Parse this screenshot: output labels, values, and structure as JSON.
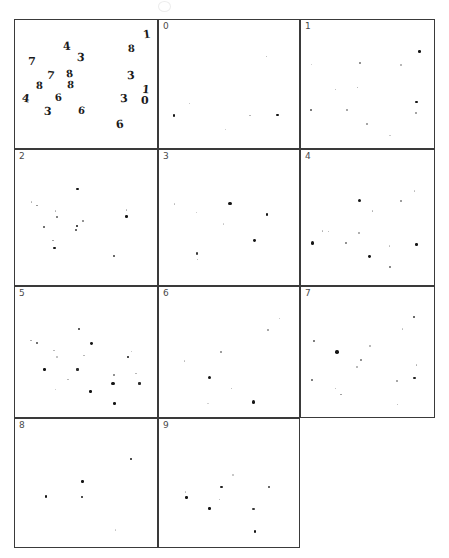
{
  "figure": {
    "width": 449,
    "height": 558,
    "background_color": "#ffffff",
    "ink_color": "#151515",
    "border_color": "#3a3a3a",
    "label_color": "#4a4a4a",
    "top_artifact_name": "faint-smudge-artifact"
  },
  "chart_data": {
    "type": "scatter",
    "title": "",
    "subtitle": "",
    "xlabel": "",
    "ylabel": "",
    "grid": false,
    "legend": "none",
    "layout": {
      "rows": 4,
      "cols": 3,
      "panel_count": 11,
      "xlim": [
        0,
        1
      ],
      "ylim": [
        0,
        1
      ],
      "axes_ticks": "none",
      "axes_frame": "box"
    },
    "panels": [
      {
        "index": 0,
        "label": "",
        "name": "handwritten-digits-panel",
        "type": "text-scatter",
        "points": [
          {
            "x": 0.915,
            "y": 0.115,
            "label": "1",
            "size": 11
          },
          {
            "x": 0.355,
            "y": 0.205,
            "label": "4",
            "size": 11
          },
          {
            "x": 0.805,
            "y": 0.225,
            "label": "8",
            "size": 10
          },
          {
            "x": 0.115,
            "y": 0.325,
            "label": "7",
            "size": 11
          },
          {
            "x": 0.455,
            "y": 0.295,
            "label": "3",
            "size": 11
          },
          {
            "x": 0.25,
            "y": 0.43,
            "label": "7",
            "size": 11
          },
          {
            "x": 0.375,
            "y": 0.42,
            "label": "8",
            "size": 10
          },
          {
            "x": 0.805,
            "y": 0.43,
            "label": "3",
            "size": 11
          },
          {
            "x": 0.165,
            "y": 0.51,
            "label": "8",
            "size": 10
          },
          {
            "x": 0.385,
            "y": 0.505,
            "label": "8",
            "size": 10
          },
          {
            "x": 0.905,
            "y": 0.535,
            "label": "1",
            "size": 11
          },
          {
            "x": 0.075,
            "y": 0.61,
            "label": "4",
            "size": 11
          },
          {
            "x": 0.3,
            "y": 0.6,
            "label": "6",
            "size": 10
          },
          {
            "x": 0.755,
            "y": 0.61,
            "label": "3",
            "size": 11
          },
          {
            "x": 0.9,
            "y": 0.625,
            "label": "0",
            "size": 11
          },
          {
            "x": 0.225,
            "y": 0.71,
            "label": "3",
            "size": 11
          },
          {
            "x": 0.46,
            "y": 0.705,
            "label": "6",
            "size": 10
          },
          {
            "x": 0.725,
            "y": 0.805,
            "label": "6",
            "size": 11
          }
        ]
      },
      {
        "index": 1,
        "label": "0",
        "name": "class-panel-0",
        "type": "scatter",
        "points": [
          {
            "x": 0.755,
            "y": 0.28,
            "size": 1.2,
            "alpha": 0.35
          },
          {
            "x": 0.215,
            "y": 0.645,
            "size": 1.3,
            "alpha": 0.3
          },
          {
            "x": 0.105,
            "y": 0.735,
            "size": 2.4,
            "alpha": 1.0
          },
          {
            "x": 0.64,
            "y": 0.735,
            "size": 1.5,
            "alpha": 0.35
          },
          {
            "x": 0.835,
            "y": 0.73,
            "size": 2.6,
            "alpha": 1.0
          },
          {
            "x": 0.47,
            "y": 0.84,
            "size": 1.4,
            "alpha": 0.28
          }
        ]
      },
      {
        "index": 2,
        "label": "1",
        "name": "class-panel-1",
        "type": "scatter",
        "points": [
          {
            "x": 0.875,
            "y": 0.245,
            "size": 3.0,
            "alpha": 1.0
          },
          {
            "x": 0.435,
            "y": 0.33,
            "size": 2.0,
            "alpha": 0.6
          },
          {
            "x": 0.74,
            "y": 0.345,
            "size": 1.4,
            "alpha": 0.35
          },
          {
            "x": 0.08,
            "y": 0.34,
            "size": 1.2,
            "alpha": 0.25
          },
          {
            "x": 0.255,
            "y": 0.535,
            "size": 1.5,
            "alpha": 0.35
          },
          {
            "x": 0.42,
            "y": 0.52,
            "size": 1.6,
            "alpha": 0.4
          },
          {
            "x": 0.855,
            "y": 0.63,
            "size": 2.6,
            "alpha": 1.0
          },
          {
            "x": 0.075,
            "y": 0.69,
            "size": 2.2,
            "alpha": 0.75
          },
          {
            "x": 0.34,
            "y": 0.69,
            "size": 1.8,
            "alpha": 0.45
          },
          {
            "x": 0.85,
            "y": 0.715,
            "size": 1.5,
            "alpha": 0.45
          },
          {
            "x": 0.49,
            "y": 0.8,
            "size": 1.6,
            "alpha": 0.45
          },
          {
            "x": 0.66,
            "y": 0.89,
            "size": 1.3,
            "alpha": 0.25
          }
        ]
      },
      {
        "index": 3,
        "label": "2",
        "name": "class-panel-2",
        "type": "scatter",
        "points": [
          {
            "x": 0.435,
            "y": 0.285,
            "size": 2.8,
            "alpha": 1.0
          },
          {
            "x": 0.115,
            "y": 0.38,
            "size": 1.6,
            "alpha": 0.35
          },
          {
            "x": 0.155,
            "y": 0.405,
            "size": 1.8,
            "alpha": 0.5
          },
          {
            "x": 0.28,
            "y": 0.445,
            "size": 1.6,
            "alpha": 0.35
          },
          {
            "x": 0.775,
            "y": 0.44,
            "size": 1.6,
            "alpha": 0.35
          },
          {
            "x": 0.29,
            "y": 0.49,
            "size": 2.2,
            "alpha": 0.7
          },
          {
            "x": 0.775,
            "y": 0.485,
            "size": 3.0,
            "alpha": 1.0
          },
          {
            "x": 0.47,
            "y": 0.52,
            "size": 1.8,
            "alpha": 0.55
          },
          {
            "x": 0.43,
            "y": 0.555,
            "size": 2.6,
            "alpha": 1.0
          },
          {
            "x": 0.2,
            "y": 0.565,
            "size": 2.2,
            "alpha": 0.8
          },
          {
            "x": 0.425,
            "y": 0.585,
            "size": 2.2,
            "alpha": 0.85
          },
          {
            "x": 0.265,
            "y": 0.66,
            "size": 1.8,
            "alpha": 0.45
          },
          {
            "x": 0.275,
            "y": 0.715,
            "size": 2.6,
            "alpha": 1.0
          },
          {
            "x": 0.685,
            "y": 0.775,
            "size": 2.2,
            "alpha": 0.85
          }
        ]
      },
      {
        "index": 4,
        "label": "3",
        "name": "class-panel-3",
        "type": "scatter",
        "points": [
          {
            "x": 0.11,
            "y": 0.395,
            "size": 1.4,
            "alpha": 0.3
          },
          {
            "x": 0.5,
            "y": 0.39,
            "size": 3.6,
            "alpha": 1.0
          },
          {
            "x": 0.265,
            "y": 0.455,
            "size": 1.4,
            "alpha": 0.28
          },
          {
            "x": 0.76,
            "y": 0.47,
            "size": 2.8,
            "alpha": 1.0
          },
          {
            "x": 0.455,
            "y": 0.54,
            "size": 1.3,
            "alpha": 0.25
          },
          {
            "x": 0.675,
            "y": 0.66,
            "size": 3.2,
            "alpha": 1.0
          },
          {
            "x": 0.265,
            "y": 0.755,
            "size": 2.2,
            "alpha": 0.85
          },
          {
            "x": 0.27,
            "y": 0.8,
            "size": 1.5,
            "alpha": 0.35
          }
        ]
      },
      {
        "index": 5,
        "label": "4",
        "name": "class-panel-4",
        "type": "scatter",
        "points": [
          {
            "x": 0.84,
            "y": 0.3,
            "size": 1.4,
            "alpha": 0.3
          },
          {
            "x": 0.435,
            "y": 0.37,
            "size": 3.4,
            "alpha": 1.0
          },
          {
            "x": 0.74,
            "y": 0.375,
            "size": 1.8,
            "alpha": 0.5
          },
          {
            "x": 0.53,
            "y": 0.445,
            "size": 1.6,
            "alpha": 0.35
          },
          {
            "x": 0.16,
            "y": 0.59,
            "size": 1.6,
            "alpha": 0.35
          },
          {
            "x": 0.205,
            "y": 0.595,
            "size": 1.6,
            "alpha": 0.35
          },
          {
            "x": 0.43,
            "y": 0.605,
            "size": 1.6,
            "alpha": 0.4
          },
          {
            "x": 0.085,
            "y": 0.68,
            "size": 3.4,
            "alpha": 1.0
          },
          {
            "x": 0.33,
            "y": 0.68,
            "size": 2.0,
            "alpha": 0.6
          },
          {
            "x": 0.655,
            "y": 0.7,
            "size": 1.5,
            "alpha": 0.3
          },
          {
            "x": 0.855,
            "y": 0.69,
            "size": 2.8,
            "alpha": 1.0
          },
          {
            "x": 0.505,
            "y": 0.775,
            "size": 3.2,
            "alpha": 1.0
          },
          {
            "x": 0.66,
            "y": 0.855,
            "size": 2.0,
            "alpha": 0.65
          }
        ]
      },
      {
        "index": 6,
        "label": "5",
        "name": "class-panel-5",
        "type": "scatter",
        "points": [
          {
            "x": 0.445,
            "y": 0.32,
            "size": 2.2,
            "alpha": 0.9
          },
          {
            "x": 0.11,
            "y": 0.405,
            "size": 1.8,
            "alpha": 0.4
          },
          {
            "x": 0.15,
            "y": 0.425,
            "size": 2.2,
            "alpha": 0.8
          },
          {
            "x": 0.53,
            "y": 0.43,
            "size": 3.2,
            "alpha": 1.0
          },
          {
            "x": 0.27,
            "y": 0.48,
            "size": 1.6,
            "alpha": 0.35
          },
          {
            "x": 0.81,
            "y": 0.49,
            "size": 1.5,
            "alpha": 0.3
          },
          {
            "x": 0.48,
            "y": 0.52,
            "size": 1.6,
            "alpha": 0.35
          },
          {
            "x": 0.29,
            "y": 0.53,
            "size": 1.5,
            "alpha": 0.3
          },
          {
            "x": 0.785,
            "y": 0.53,
            "size": 2.8,
            "alpha": 1.0
          },
          {
            "x": 0.205,
            "y": 0.625,
            "size": 2.6,
            "alpha": 1.0
          },
          {
            "x": 0.435,
            "y": 0.625,
            "size": 2.4,
            "alpha": 0.9
          },
          {
            "x": 0.69,
            "y": 0.665,
            "size": 2.0,
            "alpha": 0.6
          },
          {
            "x": 0.84,
            "y": 0.655,
            "size": 1.6,
            "alpha": 0.35
          },
          {
            "x": 0.37,
            "y": 0.7,
            "size": 1.6,
            "alpha": 0.35
          },
          {
            "x": 0.68,
            "y": 0.73,
            "size": 3.4,
            "alpha": 1.0
          },
          {
            "x": 0.865,
            "y": 0.73,
            "size": 2.4,
            "alpha": 0.9
          },
          {
            "x": 0.28,
            "y": 0.775,
            "size": 1.5,
            "alpha": 0.28
          },
          {
            "x": 0.525,
            "y": 0.79,
            "size": 2.6,
            "alpha": 1.0
          },
          {
            "x": 0.69,
            "y": 0.885,
            "size": 3.0,
            "alpha": 1.0
          }
        ]
      },
      {
        "index": 7,
        "label": "6",
        "name": "class-panel-6",
        "type": "scatter",
        "points": [
          {
            "x": 0.85,
            "y": 0.24,
            "size": 1.5,
            "alpha": 0.3
          },
          {
            "x": 0.765,
            "y": 0.325,
            "size": 1.8,
            "alpha": 0.45
          },
          {
            "x": 0.435,
            "y": 0.49,
            "size": 1.8,
            "alpha": 0.5
          },
          {
            "x": 0.18,
            "y": 0.56,
            "size": 1.6,
            "alpha": 0.3
          },
          {
            "x": 0.355,
            "y": 0.685,
            "size": 3.6,
            "alpha": 1.0
          },
          {
            "x": 0.51,
            "y": 0.77,
            "size": 1.6,
            "alpha": 0.35
          },
          {
            "x": 0.665,
            "y": 0.87,
            "size": 3.4,
            "alpha": 1.0
          },
          {
            "x": 0.345,
            "y": 0.885,
            "size": 1.3,
            "alpha": 0.22
          }
        ]
      },
      {
        "index": 8,
        "label": "7",
        "name": "class-panel-7",
        "type": "scatter",
        "points": [
          {
            "x": 0.835,
            "y": 0.23,
            "size": 2.2,
            "alpha": 0.85
          },
          {
            "x": 0.75,
            "y": 0.32,
            "size": 1.5,
            "alpha": 0.3
          },
          {
            "x": 0.095,
            "y": 0.41,
            "size": 2.0,
            "alpha": 0.7
          },
          {
            "x": 0.51,
            "y": 0.445,
            "size": 1.6,
            "alpha": 0.35
          },
          {
            "x": 0.265,
            "y": 0.495,
            "size": 3.8,
            "alpha": 1.0
          },
          {
            "x": 0.445,
            "y": 0.555,
            "size": 2.0,
            "alpha": 0.6
          },
          {
            "x": 0.415,
            "y": 0.605,
            "size": 1.6,
            "alpha": 0.35
          },
          {
            "x": 0.855,
            "y": 0.59,
            "size": 1.6,
            "alpha": 0.35
          },
          {
            "x": 0.84,
            "y": 0.69,
            "size": 2.4,
            "alpha": 0.95
          },
          {
            "x": 0.085,
            "y": 0.705,
            "size": 2.0,
            "alpha": 0.7
          },
          {
            "x": 0.71,
            "y": 0.71,
            "size": 1.8,
            "alpha": 0.45
          },
          {
            "x": 0.255,
            "y": 0.77,
            "size": 1.6,
            "alpha": 0.35
          },
          {
            "x": 0.295,
            "y": 0.815,
            "size": 1.8,
            "alpha": 0.45
          },
          {
            "x": 0.715,
            "y": 0.89,
            "size": 1.6,
            "alpha": 0.35
          }
        ]
      },
      {
        "index": 9,
        "label": "8",
        "name": "class-panel-8",
        "type": "scatter",
        "points": [
          {
            "x": 0.805,
            "y": 0.31,
            "size": 2.4,
            "alpha": 1.0
          },
          {
            "x": 0.47,
            "y": 0.48,
            "size": 2.6,
            "alpha": 1.0
          },
          {
            "x": 0.215,
            "y": 0.595,
            "size": 2.4,
            "alpha": 1.0
          },
          {
            "x": 0.465,
            "y": 0.6,
            "size": 2.4,
            "alpha": 1.0
          },
          {
            "x": 0.7,
            "y": 0.855,
            "size": 1.4,
            "alpha": 0.25
          }
        ]
      },
      {
        "index": 10,
        "label": "9",
        "name": "class-panel-9",
        "type": "scatter",
        "points": [
          {
            "x": 0.52,
            "y": 0.43,
            "size": 1.4,
            "alpha": 0.28
          },
          {
            "x": 0.44,
            "y": 0.525,
            "size": 2.4,
            "alpha": 0.95
          },
          {
            "x": 0.775,
            "y": 0.52,
            "size": 2.2,
            "alpha": 0.85
          },
          {
            "x": 0.185,
            "y": 0.56,
            "size": 1.5,
            "alpha": 0.3
          },
          {
            "x": 0.195,
            "y": 0.605,
            "size": 2.6,
            "alpha": 1.0
          },
          {
            "x": 0.425,
            "y": 0.62,
            "size": 1.6,
            "alpha": 0.35
          },
          {
            "x": 0.355,
            "y": 0.69,
            "size": 2.6,
            "alpha": 1.0
          },
          {
            "x": 0.665,
            "y": 0.69,
            "size": 2.2,
            "alpha": 0.85
          },
          {
            "x": 0.675,
            "y": 0.865,
            "size": 2.6,
            "alpha": 1.0
          }
        ]
      }
    ]
  }
}
